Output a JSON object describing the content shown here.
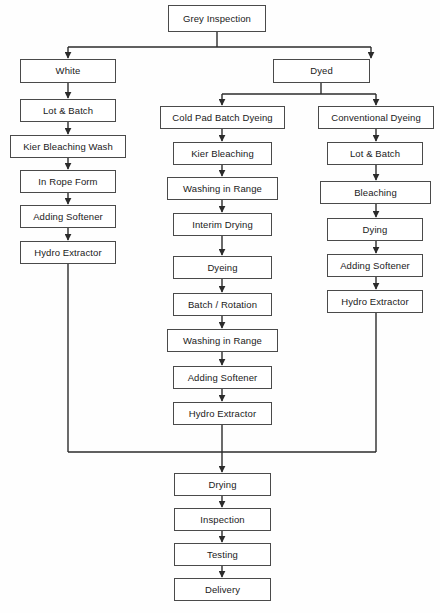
{
  "diagram": {
    "colors": {
      "box_border": "#4a4a4a",
      "box_fill": "#ffffff",
      "line": "#2b2b2b",
      "text": "#1a1a1a",
      "background": "#fefefe"
    },
    "nodes": [
      {
        "id": "grey_inspection",
        "label": "Grey Inspection",
        "x": 168,
        "y": 5,
        "w": 98,
        "h": 27,
        "column": "root"
      },
      {
        "id": "white",
        "label": "White",
        "x": 20,
        "y": 59,
        "w": 96,
        "h": 24,
        "column": "left"
      },
      {
        "id": "dyed",
        "label": "Dyed",
        "x": 273,
        "y": 59,
        "w": 97,
        "h": 24,
        "column": "root-right"
      },
      {
        "id": "left_lot_batch",
        "label": "Lot & Batch",
        "x": 20,
        "y": 99,
        "w": 96,
        "h": 23,
        "column": "left"
      },
      {
        "id": "left_kier_wash",
        "label": "Kier Bleaching Wash",
        "x": 10,
        "y": 135,
        "w": 116,
        "h": 23,
        "column": "left"
      },
      {
        "id": "left_rope_form",
        "label": "In Rope Form",
        "x": 20,
        "y": 170,
        "w": 96,
        "h": 23,
        "column": "left"
      },
      {
        "id": "left_adding_softener",
        "label": "Adding Softener",
        "x": 20,
        "y": 205,
        "w": 96,
        "h": 23,
        "column": "left"
      },
      {
        "id": "left_hydro_extractor",
        "label": "Hydro Extractor",
        "x": 20,
        "y": 241,
        "w": 96,
        "h": 23,
        "column": "left"
      },
      {
        "id": "cold_pad_batch",
        "label": "Cold Pad Batch Dyeing",
        "x": 160,
        "y": 106,
        "w": 125,
        "h": 23,
        "column": "middle"
      },
      {
        "id": "mid_kier_bleaching",
        "label": "Kier Bleaching",
        "x": 173,
        "y": 142,
        "w": 99,
        "h": 23,
        "column": "middle"
      },
      {
        "id": "mid_washing_1",
        "label": "Washing in Range",
        "x": 167,
        "y": 177,
        "w": 111,
        "h": 23,
        "column": "middle"
      },
      {
        "id": "mid_interim_drying",
        "label": "Interim Drying",
        "x": 173,
        "y": 213,
        "w": 99,
        "h": 23,
        "column": "middle"
      },
      {
        "id": "mid_dyeing",
        "label": "Dyeing",
        "x": 173,
        "y": 256,
        "w": 99,
        "h": 23,
        "column": "middle"
      },
      {
        "id": "mid_batch_rotation",
        "label": "Batch / Rotation",
        "x": 173,
        "y": 293,
        "w": 99,
        "h": 23,
        "column": "middle"
      },
      {
        "id": "mid_washing_2",
        "label": "Washing in Range",
        "x": 167,
        "y": 329,
        "w": 111,
        "h": 23,
        "column": "middle"
      },
      {
        "id": "mid_adding_softener",
        "label": "Adding Softener",
        "x": 173,
        "y": 366,
        "w": 99,
        "h": 23,
        "column": "middle"
      },
      {
        "id": "mid_hydro_extractor",
        "label": "Hydro Extractor",
        "x": 173,
        "y": 402,
        "w": 99,
        "h": 23,
        "column": "middle"
      },
      {
        "id": "conventional_dyeing",
        "label": "Conventional Dyeing",
        "x": 318,
        "y": 106,
        "w": 116,
        "h": 23,
        "column": "right"
      },
      {
        "id": "right_lot_batch",
        "label": "Lot & Batch",
        "x": 327,
        "y": 142,
        "w": 96,
        "h": 23,
        "column": "right"
      },
      {
        "id": "right_bleaching",
        "label": "Bleaching",
        "x": 320,
        "y": 181,
        "w": 111,
        "h": 23,
        "column": "right"
      },
      {
        "id": "right_dying",
        "label": "Dying",
        "x": 327,
        "y": 218,
        "w": 96,
        "h": 23,
        "column": "right"
      },
      {
        "id": "right_adding_softener",
        "label": "Adding Softener",
        "x": 327,
        "y": 254,
        "w": 96,
        "h": 23,
        "column": "right"
      },
      {
        "id": "right_hydro_extractor",
        "label": "Hydro Extractor",
        "x": 327,
        "y": 290,
        "w": 96,
        "h": 23,
        "column": "right"
      },
      {
        "id": "drying",
        "label": "Drying",
        "x": 174,
        "y": 473,
        "w": 97,
        "h": 23,
        "column": "bottom"
      },
      {
        "id": "inspection",
        "label": "Inspection",
        "x": 174,
        "y": 508,
        "w": 97,
        "h": 23,
        "column": "bottom"
      },
      {
        "id": "testing",
        "label": "Testing",
        "x": 174,
        "y": 543,
        "w": 97,
        "h": 23,
        "column": "bottom"
      },
      {
        "id": "delivery",
        "label": "Delivery",
        "x": 174,
        "y": 578,
        "w": 97,
        "h": 23,
        "column": "bottom"
      }
    ],
    "edges": [
      {
        "from": "grey_inspection",
        "to": "white",
        "kind": "split-left"
      },
      {
        "from": "grey_inspection",
        "to": "dyed",
        "kind": "split-right"
      },
      {
        "from": "white",
        "to": "left_lot_batch",
        "kind": "straight"
      },
      {
        "from": "left_lot_batch",
        "to": "left_kier_wash",
        "kind": "straight"
      },
      {
        "from": "left_kier_wash",
        "to": "left_rope_form",
        "kind": "straight"
      },
      {
        "from": "left_rope_form",
        "to": "left_adding_softener",
        "kind": "straight"
      },
      {
        "from": "left_adding_softener",
        "to": "left_hydro_extractor",
        "kind": "straight"
      },
      {
        "from": "left_hydro_extractor",
        "to": "merge_bar",
        "kind": "down-to-merge"
      },
      {
        "from": "dyed",
        "to": "cold_pad_batch",
        "kind": "split-left"
      },
      {
        "from": "dyed",
        "to": "conventional_dyeing",
        "kind": "split-right"
      },
      {
        "from": "cold_pad_batch",
        "to": "mid_kier_bleaching",
        "kind": "straight"
      },
      {
        "from": "mid_kier_bleaching",
        "to": "mid_washing_1",
        "kind": "straight"
      },
      {
        "from": "mid_washing_1",
        "to": "mid_interim_drying",
        "kind": "straight"
      },
      {
        "from": "mid_interim_drying",
        "to": "mid_dyeing",
        "kind": "straight"
      },
      {
        "from": "mid_dyeing",
        "to": "mid_batch_rotation",
        "kind": "straight"
      },
      {
        "from": "mid_batch_rotation",
        "to": "mid_washing_2",
        "kind": "straight"
      },
      {
        "from": "mid_washing_2",
        "to": "mid_adding_softener",
        "kind": "straight"
      },
      {
        "from": "mid_adding_softener",
        "to": "mid_hydro_extractor",
        "kind": "straight"
      },
      {
        "from": "mid_hydro_extractor",
        "to": "merge_bar",
        "kind": "down-to-merge"
      },
      {
        "from": "conventional_dyeing",
        "to": "right_lot_batch",
        "kind": "straight"
      },
      {
        "from": "right_lot_batch",
        "to": "right_bleaching",
        "kind": "straight"
      },
      {
        "from": "right_bleaching",
        "to": "right_dying",
        "kind": "straight"
      },
      {
        "from": "right_dying",
        "to": "right_adding_softener",
        "kind": "straight"
      },
      {
        "from": "right_adding_softener",
        "to": "right_hydro_extractor",
        "kind": "straight"
      },
      {
        "from": "right_hydro_extractor",
        "to": "merge_bar",
        "kind": "down-to-merge"
      },
      {
        "from": "merge_bar",
        "to": "drying",
        "kind": "straight"
      },
      {
        "from": "drying",
        "to": "inspection",
        "kind": "straight"
      },
      {
        "from": "inspection",
        "to": "testing",
        "kind": "straight"
      },
      {
        "from": "testing",
        "to": "delivery",
        "kind": "straight"
      }
    ]
  }
}
